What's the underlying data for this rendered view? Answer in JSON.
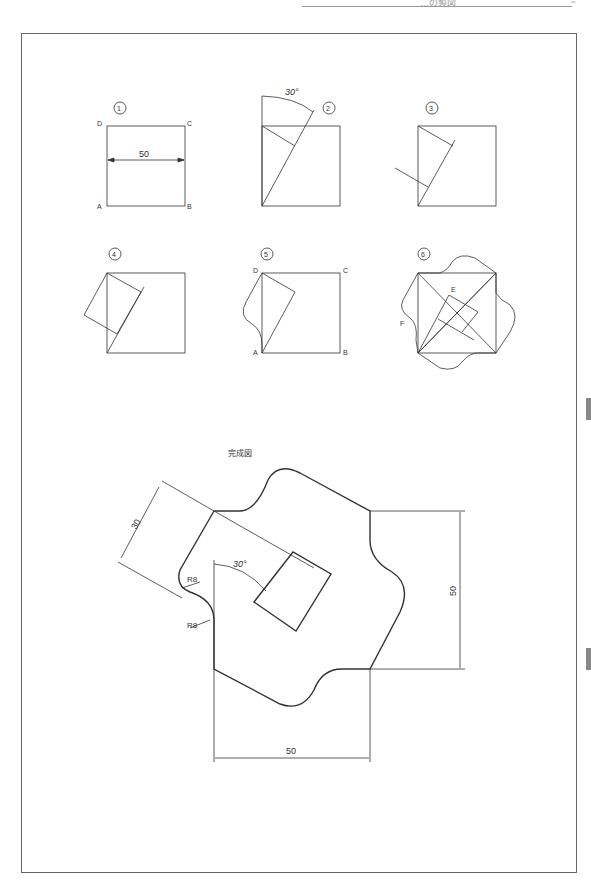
{
  "header": {
    "title": "…の製図",
    "menu_icon": "menu-lines-icon"
  },
  "steps": [
    {
      "label": "1",
      "vertices": {
        "D": "D",
        "C": "C",
        "A": "A",
        "B": "B"
      },
      "dimension": "50"
    },
    {
      "label": "2",
      "angle": "30°"
    },
    {
      "label": "3"
    },
    {
      "label": "4"
    },
    {
      "label": "5",
      "vertices": {
        "D": "D",
        "C": "C",
        "A": "A",
        "B": "B"
      }
    },
    {
      "label": "6",
      "points": {
        "E": "E",
        "F": "F"
      }
    }
  ],
  "final": {
    "title": "完成図",
    "dims": {
      "d30": "30",
      "angle": "30°",
      "r1": "R8",
      "r2": "R8",
      "height": "50",
      "width": "50"
    }
  }
}
